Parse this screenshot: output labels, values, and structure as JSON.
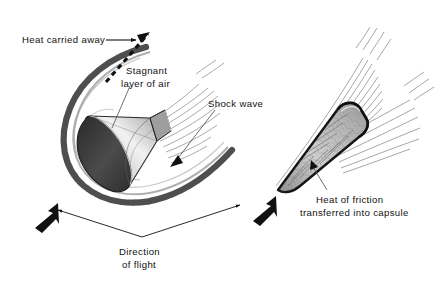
{
  "figure": {
    "background_color": "#ffffff",
    "ink_color": "#111111",
    "width": 440,
    "height": 282
  },
  "labels": {
    "heat_carried_away": "Heat carried away",
    "stagnant_layer_line1": "Stagnant",
    "stagnant_layer_line2": "layer of air",
    "shock_wave": "Shock wave",
    "heat_friction_line1": "Heat of friction",
    "heat_friction_line2": "transferred into capsule",
    "direction_line1": "Direction",
    "direction_line2": "of flight"
  },
  "panels": {
    "left": {
      "name": "blunt-body-capsule-panel",
      "description": "Blunt cone capsule with detached bow shock and stagnant layer of air",
      "capsule_shield_color": "#3a3a3a",
      "capsule_body_color": "#c9c9c9",
      "shock_color": "#4a4a4a"
    },
    "right": {
      "name": "sharp-cone-capsule-panel",
      "description": "Sharp nose cone with attached shock, heat conducted into capsule",
      "capsule_body_color": "#b8b8b8",
      "outline_color": "#141414"
    }
  },
  "arrows": {
    "heat_carried_away_style": "dashed",
    "direction_of_flight_count": 2,
    "direction_of_flight_heading": "down-left"
  }
}
